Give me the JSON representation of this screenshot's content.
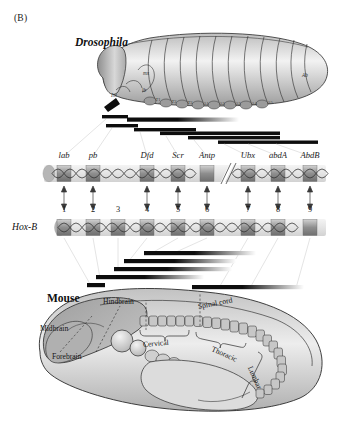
{
  "figure": {
    "panel_label": "(B)",
    "caption_topic": "Hox gene cluster homology between Drosophila and Mouse"
  },
  "drosophila": {
    "name": "Drosophila",
    "segment_labels": [
      "T1",
      "T2",
      "T3",
      "A1",
      "A2",
      "A3",
      "A4",
      "A5",
      "A6",
      "A7",
      "A8"
    ],
    "head_labels": [
      "Int",
      "mx",
      "lb",
      "Ab"
    ],
    "row_label": "",
    "genes": [
      {
        "name": "lab",
        "x": 64
      },
      {
        "name": "pb",
        "x": 93
      },
      {
        "name": "Dfd",
        "x": 147
      },
      {
        "name": "Scr",
        "x": 178
      },
      {
        "name": "Antp",
        "x": 207
      },
      {
        "name": "Ubx",
        "x": 248
      },
      {
        "name": "abdA",
        "x": 278
      },
      {
        "name": "AbdB",
        "x": 310
      }
    ]
  },
  "mouse": {
    "name": "Mouse",
    "row_label": "Hox-B",
    "gene_numbers": [
      "1",
      "2",
      "3",
      "4",
      "5",
      "6",
      "7",
      "8",
      "9"
    ],
    "gene_number_x": [
      64,
      93,
      118,
      147,
      178,
      207,
      248,
      278,
      310
    ],
    "anatomy": [
      {
        "label": "Hindbrain",
        "x": 124,
        "y": 300,
        "rot": 0
      },
      {
        "label": "Midbrain",
        "x": 52,
        "y": 327,
        "rot": 0
      },
      {
        "label": "Forebrain",
        "x": 66,
        "y": 355,
        "rot": 0
      },
      {
        "label": "Spinal cord",
        "x": 200,
        "y": 305,
        "rot": -11
      },
      {
        "label": "Cervical",
        "x": 163,
        "y": 340,
        "rot": -6
      },
      {
        "label": "Thoracic",
        "x": 227,
        "y": 345,
        "rot": 24
      },
      {
        "label": "Lumbar",
        "x": 258,
        "y": 368,
        "rot": 66
      }
    ]
  },
  "expression_bars": {
    "description": "Anterior-posterior expression domains shown as black bars fading posteriorly",
    "drosophila_bars": [
      {
        "x": 102,
        "y": 116,
        "w": 26,
        "fade": false
      },
      {
        "x": 127,
        "y": 118,
        "w": 110,
        "fade": true
      },
      {
        "x": 106,
        "y": 125,
        "w": 32,
        "fade": false
      },
      {
        "x": 134,
        "y": 128,
        "w": 62,
        "fade": false
      },
      {
        "x": 161,
        "y": 131,
        "w": 119,
        "fade": false
      },
      {
        "x": 189,
        "y": 136,
        "w": 91,
        "fade": false
      },
      {
        "x": 219,
        "y": 141,
        "w": 99,
        "fade": false
      }
    ],
    "mouse_bars": [
      {
        "x": 144,
        "y": 252,
        "w": 110,
        "fade": true
      },
      {
        "x": 124,
        "y": 260,
        "w": 110,
        "fade": true
      },
      {
        "x": 116,
        "y": 268,
        "w": 116,
        "fade": true
      },
      {
        "x": 98,
        "y": 276,
        "w": 106,
        "fade": true
      },
      {
        "x": 88,
        "y": 284,
        "w": 18,
        "fade": false
      },
      {
        "x": 193,
        "y": 286,
        "w": 110,
        "fade": true
      }
    ]
  },
  "colors": {
    "chromosome_fill": "#e9e9e9",
    "gene_box": "#9a9a9a",
    "bar_black": "#0d0d0d",
    "embryo_gray": "#a9a9a9",
    "embryo_light": "#e2e2e2",
    "outline": "#2b2b2b",
    "leader_line": "#c9c9c9"
  }
}
